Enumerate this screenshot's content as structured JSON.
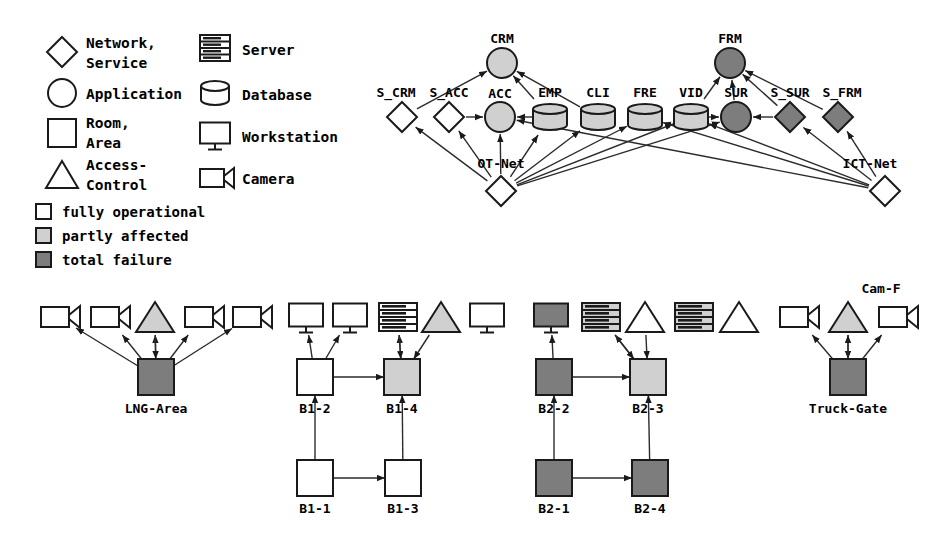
{
  "legend": {
    "shapes": [
      {
        "id": "network-service",
        "icon": "diamond-icon",
        "label_lines": [
          "Network,",
          "Service"
        ]
      },
      {
        "id": "application",
        "icon": "circle-icon",
        "label_lines": [
          "Application"
        ]
      },
      {
        "id": "room-area",
        "icon": "square-icon",
        "label_lines": [
          "Room,",
          "Area"
        ]
      },
      {
        "id": "access-control",
        "icon": "triangle-icon",
        "label_lines": [
          "Access-",
          "Control"
        ]
      },
      {
        "id": "server",
        "icon": "server-icon",
        "label_lines": [
          "Server"
        ]
      },
      {
        "id": "database",
        "icon": "database-icon",
        "label_lines": [
          "Database"
        ]
      },
      {
        "id": "workstation",
        "icon": "workstation-icon",
        "label_lines": [
          "Workstation"
        ]
      },
      {
        "id": "camera",
        "icon": "camera-icon",
        "label_lines": [
          "Camera"
        ]
      }
    ],
    "status": [
      {
        "id": "fully-operational",
        "label": "fully operational",
        "color": "#ffffff"
      },
      {
        "id": "partly-affected",
        "label": "partly affected",
        "color": "#d0d0d0"
      },
      {
        "id": "total-failure",
        "label": "total failure",
        "color": "#7d7d7d"
      }
    ]
  },
  "colors": {
    "fully_operational": "#ffffff",
    "partly_affected": "#d0d0d0",
    "total_failure": "#7d7d7d",
    "stroke": "#1a1a1a",
    "edge": "#2b2b2b"
  },
  "nodes": [
    {
      "id": "CRM",
      "label": "CRM",
      "type": "application",
      "status": "partly_affected",
      "x": 502,
      "y": 63,
      "label_x": 502,
      "label_y": 43
    },
    {
      "id": "FRM",
      "label": "FRM",
      "type": "application",
      "status": "total_failure",
      "x": 730,
      "y": 63,
      "label_x": 730,
      "label_y": 43
    },
    {
      "id": "S_CRM",
      "label": "S_CRM",
      "type": "network",
      "status": "fully_operational",
      "x": 402,
      "y": 117,
      "label_x": 396,
      "label_y": 97
    },
    {
      "id": "S_ACC",
      "label": "S_ACC",
      "type": "network",
      "status": "fully_operational",
      "x": 449,
      "y": 117,
      "label_x": 449,
      "label_y": 97
    },
    {
      "id": "ACC",
      "label": "ACC",
      "type": "application",
      "status": "partly_affected",
      "x": 500,
      "y": 117,
      "label_x": 500,
      "label_y": 98
    },
    {
      "id": "EMP",
      "label": "EMP",
      "type": "database",
      "status": "partly_affected",
      "x": 550,
      "y": 117,
      "label_x": 550,
      "label_y": 97
    },
    {
      "id": "CLI",
      "label": "CLI",
      "type": "database",
      "status": "partly_affected",
      "x": 598,
      "y": 117,
      "label_x": 598,
      "label_y": 97
    },
    {
      "id": "FRE",
      "label": "FRE",
      "type": "database",
      "status": "partly_affected",
      "x": 645,
      "y": 117,
      "label_x": 645,
      "label_y": 97
    },
    {
      "id": "VID",
      "label": "VID",
      "type": "database",
      "status": "partly_affected",
      "x": 691,
      "y": 117,
      "label_x": 691,
      "label_y": 97
    },
    {
      "id": "SUR",
      "label": "SUR",
      "type": "application",
      "status": "total_failure",
      "x": 736,
      "y": 117,
      "label_x": 736,
      "label_y": 97
    },
    {
      "id": "S_SUR",
      "label": "S_SUR",
      "type": "network",
      "status": "total_failure",
      "x": 790,
      "y": 117,
      "label_x": 790,
      "label_y": 97
    },
    {
      "id": "S_FRM",
      "label": "S_FRM",
      "type": "network",
      "status": "total_failure",
      "x": 838,
      "y": 117,
      "label_x": 842,
      "label_y": 97
    },
    {
      "id": "OT-Net",
      "label": "OT-Net",
      "type": "network",
      "status": "fully_operational",
      "x": 501,
      "y": 191,
      "label_x": 501,
      "label_y": 168
    },
    {
      "id": "ICT-Net",
      "label": "ICT-Net",
      "type": "network",
      "status": "fully_operational",
      "x": 885,
      "y": 191,
      "label_x": 870,
      "label_y": 168
    },
    {
      "id": "cam-l1",
      "label": "",
      "type": "camera",
      "status": "fully_operational",
      "x": 58,
      "y": 317
    },
    {
      "id": "cam-l2",
      "label": "",
      "type": "camera",
      "status": "fully_operational",
      "x": 108,
      "y": 317
    },
    {
      "id": "ac-l1",
      "label": "",
      "type": "access",
      "status": "partly_affected",
      "x": 155,
      "y": 317
    },
    {
      "id": "cam-l3",
      "label": "",
      "type": "camera",
      "status": "fully_operational",
      "x": 202,
      "y": 317
    },
    {
      "id": "cam-l4",
      "label": "",
      "type": "camera",
      "status": "fully_operational",
      "x": 250,
      "y": 317
    },
    {
      "id": "ws-b1a",
      "label": "",
      "type": "workstation",
      "status": "fully_operational",
      "x": 306,
      "y": 317
    },
    {
      "id": "ws-b1b",
      "label": "",
      "type": "workstation",
      "status": "fully_operational",
      "x": 350,
      "y": 317
    },
    {
      "id": "srv-b1",
      "label": "",
      "type": "server",
      "status": "fully_operational",
      "x": 398,
      "y": 317
    },
    {
      "id": "ac-b1",
      "label": "",
      "type": "access",
      "status": "partly_affected",
      "x": 441,
      "y": 317
    },
    {
      "id": "ws-b1c",
      "label": "",
      "type": "workstation",
      "status": "fully_operational",
      "x": 487,
      "y": 317
    },
    {
      "id": "ws-b2a",
      "label": "",
      "type": "workstation",
      "status": "total_failure",
      "x": 551,
      "y": 317
    },
    {
      "id": "srv-b2a",
      "label": "",
      "type": "server",
      "status": "partly_affected",
      "x": 601,
      "y": 317
    },
    {
      "id": "ac-b2a",
      "label": "",
      "type": "access",
      "status": "fully_operational",
      "x": 645,
      "y": 317
    },
    {
      "id": "srv-b2b",
      "label": "",
      "type": "server",
      "status": "partly_affected",
      "x": 694,
      "y": 317
    },
    {
      "id": "ac-b2b",
      "label": "",
      "type": "access",
      "status": "fully_operational",
      "x": 739,
      "y": 317
    },
    {
      "id": "cam-t1",
      "label": "",
      "type": "camera",
      "status": "fully_operational",
      "x": 797,
      "y": 317
    },
    {
      "id": "ac-t1",
      "label": "",
      "type": "access",
      "status": "partly_affected",
      "x": 848,
      "y": 317
    },
    {
      "id": "Cam-F",
      "label": "Cam-F",
      "type": "camera",
      "status": "fully_operational",
      "x": 896,
      "y": 317,
      "label_x": 881,
      "label_y": 293
    },
    {
      "id": "LNG-Area",
      "label": "LNG-Area",
      "type": "room",
      "status": "total_failure",
      "x": 156,
      "y": 377,
      "label_x": 156,
      "label_y": 413
    },
    {
      "id": "B1-2",
      "label": "B1-2",
      "type": "room",
      "status": "fully_operational",
      "x": 315,
      "y": 377,
      "label_x": 315,
      "label_y": 413
    },
    {
      "id": "B1-4",
      "label": "B1-4",
      "type": "room",
      "status": "partly_affected",
      "x": 402,
      "y": 377,
      "label_x": 402,
      "label_y": 413
    },
    {
      "id": "B2-2",
      "label": "B2-2",
      "type": "room",
      "status": "total_failure",
      "x": 554,
      "y": 377,
      "label_x": 554,
      "label_y": 413
    },
    {
      "id": "B2-3",
      "label": "B2-3",
      "type": "room",
      "status": "partly_affected",
      "x": 648,
      "y": 377,
      "label_x": 648,
      "label_y": 413
    },
    {
      "id": "Truck-Gate",
      "label": "Truck-Gate",
      "type": "room",
      "status": "total_failure",
      "x": 848,
      "y": 377,
      "label_x": 848,
      "label_y": 413
    },
    {
      "id": "B1-1",
      "label": "B1-1",
      "type": "room",
      "status": "fully_operational",
      "x": 315,
      "y": 478,
      "label_x": 315,
      "label_y": 513
    },
    {
      "id": "B1-3",
      "label": "B1-3",
      "type": "room",
      "status": "fully_operational",
      "x": 403,
      "y": 478,
      "label_x": 403,
      "label_y": 513
    },
    {
      "id": "B2-1",
      "label": "B2-1",
      "type": "room",
      "status": "total_failure",
      "x": 554,
      "y": 478,
      "label_x": 554,
      "label_y": 513
    },
    {
      "id": "B2-4",
      "label": "B2-4",
      "type": "room",
      "status": "total_failure",
      "x": 650,
      "y": 478,
      "label_x": 650,
      "label_y": 513
    }
  ],
  "edges": [
    {
      "from": "S_CRM",
      "to": "CRM"
    },
    {
      "from": "EMP",
      "to": "CRM"
    },
    {
      "from": "CLI",
      "to": "CRM"
    },
    {
      "from": "VID",
      "to": "FRM"
    },
    {
      "from": "SUR",
      "to": "FRM"
    },
    {
      "from": "S_SUR",
      "to": "FRM"
    },
    {
      "from": "S_FRM",
      "to": "FRM"
    },
    {
      "from": "S_ACC",
      "to": "ACC"
    },
    {
      "from": "EMP",
      "to": "ACC"
    },
    {
      "from": "VID",
      "to": "SUR"
    },
    {
      "from": "S_SUR",
      "to": "SUR"
    },
    {
      "from": "OT-Net",
      "to": "S_CRM"
    },
    {
      "from": "OT-Net",
      "to": "S_ACC"
    },
    {
      "from": "OT-Net",
      "to": "ACC"
    },
    {
      "from": "OT-Net",
      "to": "EMP"
    },
    {
      "from": "OT-Net",
      "to": "CLI"
    },
    {
      "from": "OT-Net",
      "to": "FRE"
    },
    {
      "from": "OT-Net",
      "to": "VID"
    },
    {
      "from": "OT-Net",
      "to": "SUR"
    },
    {
      "from": "ICT-Net",
      "to": "S_SUR"
    },
    {
      "from": "ICT-Net",
      "to": "S_FRM"
    },
    {
      "from": "ICT-Net",
      "to": "FRE"
    },
    {
      "from": "ICT-Net",
      "to": "VID"
    },
    {
      "from": "ICT-Net",
      "to": "ACC"
    },
    {
      "from": "LNG-Area",
      "to": "cam-l1"
    },
    {
      "from": "LNG-Area",
      "to": "cam-l2"
    },
    {
      "from": "LNG-Area",
      "to": "ac-l1"
    },
    {
      "from": "LNG-Area",
      "to": "cam-l3"
    },
    {
      "from": "LNG-Area",
      "to": "cam-l4"
    },
    {
      "from": "ac-l1",
      "to": "LNG-Area"
    },
    {
      "from": "B1-2",
      "to": "ws-b1a"
    },
    {
      "from": "B1-2",
      "to": "ws-b1b"
    },
    {
      "from": "B1-4",
      "to": "srv-b1"
    },
    {
      "from": "ac-b1",
      "to": "B1-4"
    },
    {
      "from": "srv-b1",
      "to": "B1-4"
    },
    {
      "from": "B1-2",
      "to": "B1-4"
    },
    {
      "from": "B1-1",
      "to": "B1-3"
    },
    {
      "from": "B1-1",
      "to": "B1-2"
    },
    {
      "from": "B1-3",
      "to": "B1-4"
    },
    {
      "from": "B2-2",
      "to": "ws-b2a"
    },
    {
      "from": "B2-3",
      "to": "srv-b2a"
    },
    {
      "from": "srv-b2a",
      "to": "B2-3"
    },
    {
      "from": "ac-b2a",
      "to": "B2-3"
    },
    {
      "from": "B2-2",
      "to": "B2-3"
    },
    {
      "from": "B2-1",
      "to": "B2-4"
    },
    {
      "from": "B2-1",
      "to": "B2-2"
    },
    {
      "from": "B2-4",
      "to": "B2-3"
    },
    {
      "from": "Truck-Gate",
      "to": "cam-t1"
    },
    {
      "from": "Truck-Gate",
      "to": "Cam-F"
    },
    {
      "from": "ac-t1",
      "to": "Truck-Gate"
    },
    {
      "from": "Truck-Gate",
      "to": "ac-t1"
    }
  ]
}
